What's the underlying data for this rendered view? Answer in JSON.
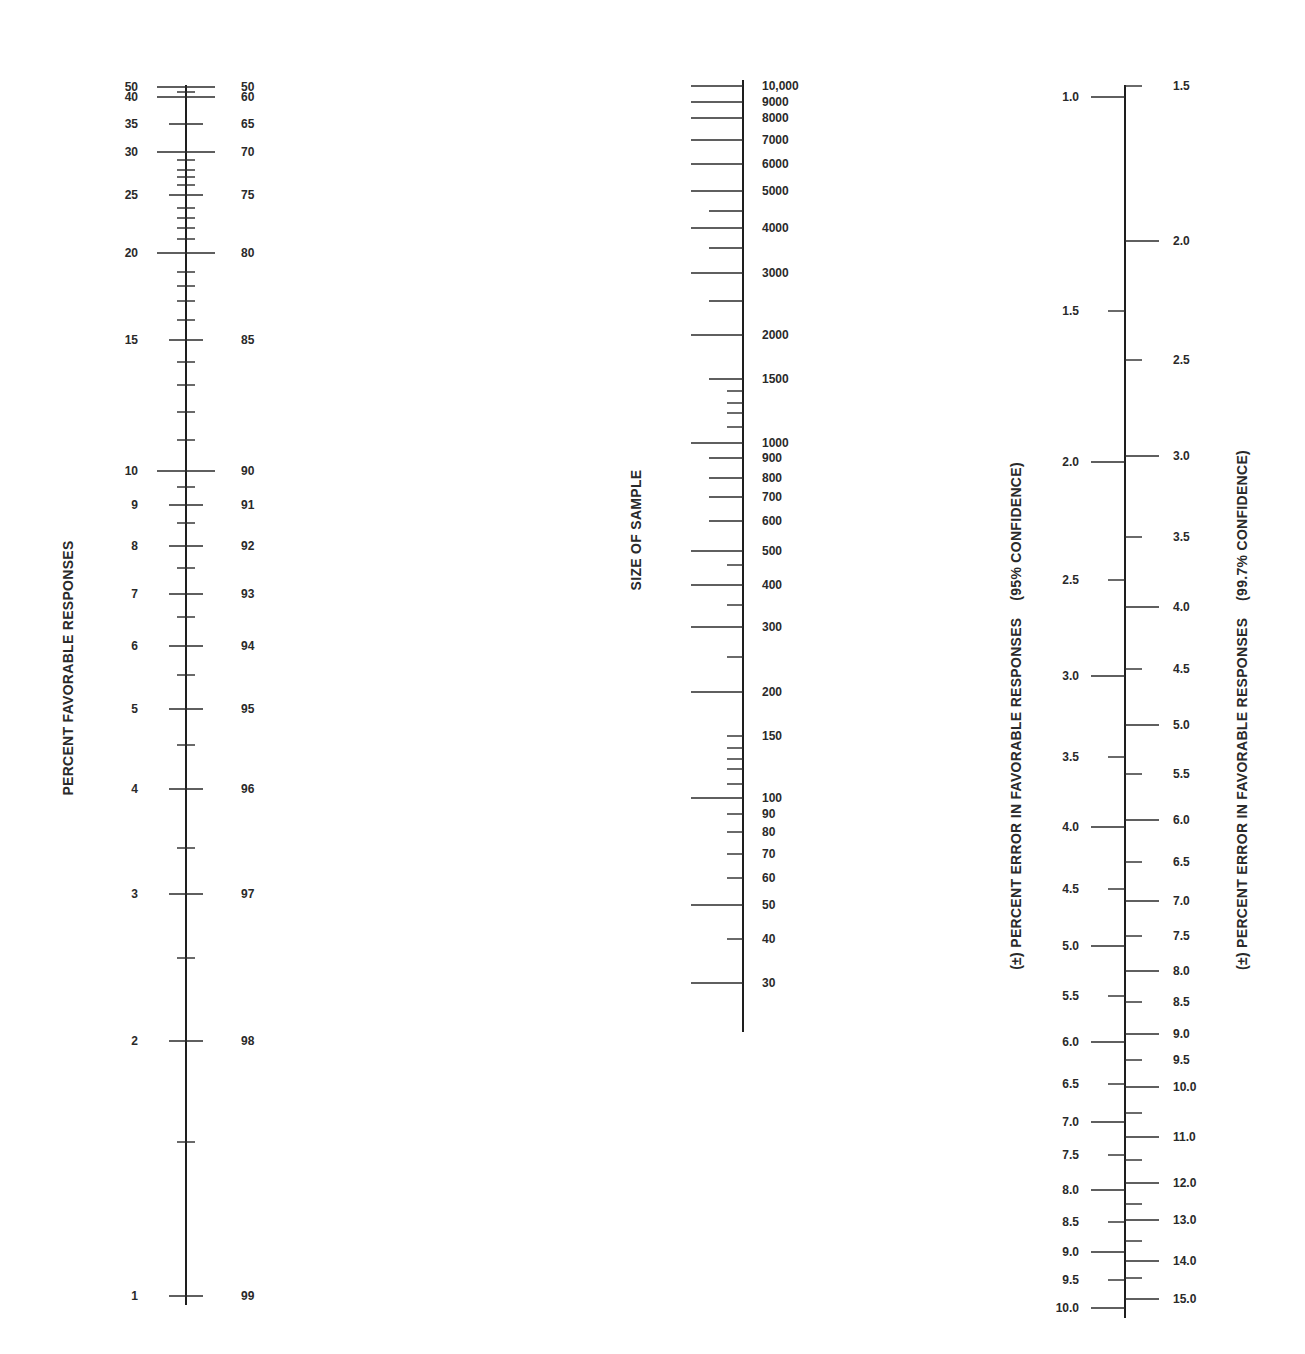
{
  "chart_data": {
    "type": "nomogram",
    "title": "",
    "scales": [
      {
        "id": "percent-favorable",
        "title": "PERCENT FAVORABLE RESPONSES",
        "axis_x": 186,
        "y_range": [
          85,
          1305
        ],
        "labels_left_x": 138,
        "labels_right_x": 241,
        "major_ticks": [
          {
            "left": "50",
            "right": "50",
            "y": 87,
            "len": "long"
          },
          {
            "left": "40",
            "right": "60",
            "y": 97,
            "len": "long"
          },
          {
            "left": "35",
            "right": "65",
            "y": 124,
            "len": "mid"
          },
          {
            "left": "30",
            "right": "70",
            "y": 152,
            "len": "long"
          },
          {
            "left": "25",
            "right": "75",
            "y": 195,
            "len": "mid"
          },
          {
            "left": "20",
            "right": "80",
            "y": 253,
            "len": "long"
          },
          {
            "left": "15",
            "right": "85",
            "y": 340,
            "len": "mid"
          },
          {
            "left": "10",
            "right": "90",
            "y": 471,
            "len": "long"
          },
          {
            "left": "9",
            "right": "91",
            "y": 505,
            "len": "mid"
          },
          {
            "left": "8",
            "right": "92",
            "y": 546,
            "len": "mid"
          },
          {
            "left": "7",
            "right": "93",
            "y": 594,
            "len": "mid"
          },
          {
            "left": "6",
            "right": "94",
            "y": 646,
            "len": "mid"
          },
          {
            "left": "5",
            "right": "95",
            "y": 709,
            "len": "mid"
          },
          {
            "left": "4",
            "right": "96",
            "y": 789,
            "len": "mid"
          },
          {
            "left": "3",
            "right": "97",
            "y": 894,
            "len": "mid"
          },
          {
            "left": "2",
            "right": "98",
            "y": 1041,
            "len": "mid"
          },
          {
            "left": "1",
            "right": "99",
            "y": 1296,
            "len": "mid"
          }
        ],
        "minor_ticks_y": [
          92,
          160,
          170,
          177,
          185,
          208,
          218,
          228,
          239,
          272,
          286,
          301,
          320,
          362,
          385,
          412,
          440,
          487,
          523,
          568,
          617,
          675,
          745,
          848,
          958,
          1142
        ]
      },
      {
        "id": "sample-size",
        "title": "SIZE OF SAMPLE",
        "axis_x": 743,
        "y_range": [
          80,
          1032
        ],
        "labels_x": 762,
        "major_ticks": [
          {
            "label": "10,000",
            "y": 86,
            "len": "long"
          },
          {
            "label": "9000",
            "y": 102,
            "len": "long"
          },
          {
            "label": "8000",
            "y": 118,
            "len": "long"
          },
          {
            "label": "7000",
            "y": 140,
            "len": "long"
          },
          {
            "label": "6000",
            "y": 164,
            "len": "long"
          },
          {
            "label": "5000",
            "y": 191,
            "len": "long"
          },
          {
            "label": "4000",
            "y": 228,
            "len": "long"
          },
          {
            "label": "3000",
            "y": 273,
            "len": "long"
          },
          {
            "label": "2000",
            "y": 335,
            "len": "long"
          },
          {
            "label": "1500",
            "y": 379,
            "len": "mid"
          },
          {
            "label": "1000",
            "y": 443,
            "len": "long"
          },
          {
            "label": "900",
            "y": 458,
            "len": "mid"
          },
          {
            "label": "800",
            "y": 478,
            "len": "mid"
          },
          {
            "label": "700",
            "y": 497,
            "len": "mid"
          },
          {
            "label": "600",
            "y": 521,
            "len": "mid"
          },
          {
            "label": "500",
            "y": 551,
            "len": "long"
          },
          {
            "label": "400",
            "y": 585,
            "len": "long"
          },
          {
            "label": "300",
            "y": 627,
            "len": "long"
          },
          {
            "label": "200",
            "y": 692,
            "len": "long"
          },
          {
            "label": "150",
            "y": 736,
            "len": "short"
          },
          {
            "label": "100",
            "y": 798,
            "len": "long"
          },
          {
            "label": "90",
            "y": 814,
            "len": "short"
          },
          {
            "label": "80",
            "y": 832,
            "len": "short"
          },
          {
            "label": "70",
            "y": 854,
            "len": "short"
          },
          {
            "label": "60",
            "y": 878,
            "len": "short"
          },
          {
            "label": "50",
            "y": 905,
            "len": "long"
          },
          {
            "label": "40",
            "y": 939,
            "len": "short"
          },
          {
            "label": "30",
            "y": 983,
            "len": "long"
          }
        ],
        "minor_ticks": [
          {
            "y": 211,
            "len": "mid"
          },
          {
            "y": 248,
            "len": "mid"
          },
          {
            "y": 301,
            "len": "mid"
          },
          {
            "y": 391,
            "len": "short"
          },
          {
            "y": 403,
            "len": "short"
          },
          {
            "y": 413,
            "len": "short"
          },
          {
            "y": 427,
            "len": "short"
          },
          {
            "y": 565,
            "len": "short"
          },
          {
            "y": 605,
            "len": "short"
          },
          {
            "y": 657,
            "len": "short"
          },
          {
            "y": 748,
            "len": "short"
          },
          {
            "y": 759,
            "len": "short"
          },
          {
            "y": 769,
            "len": "short"
          },
          {
            "y": 784,
            "len": "short"
          }
        ]
      },
      {
        "id": "percent-error",
        "axis_x": 1125,
        "y_range": [
          85,
          1318
        ],
        "left_title": "(±) PERCENT ERROR IN FAVORABLE RESPONSES    (95% CONFIDENCE)",
        "right_title": "(±) PERCENT ERROR IN FAVORABLE RESPONSES    (99.7% CONFIDENCE)",
        "left_labels_x": 1079,
        "left_ticks": [
          {
            "label": "1.0",
            "y": 97,
            "len": "long"
          },
          {
            "label": "1.5",
            "y": 311,
            "len": "short"
          },
          {
            "label": "2.0",
            "y": 462,
            "len": "long"
          },
          {
            "label": "2.5",
            "y": 580,
            "len": "short"
          },
          {
            "label": "3.0",
            "y": 676,
            "len": "long"
          },
          {
            "label": "3.5",
            "y": 757,
            "len": "short"
          },
          {
            "label": "4.0",
            "y": 827,
            "len": "long"
          },
          {
            "label": "4.5",
            "y": 889,
            "len": "short"
          },
          {
            "label": "5.0",
            "y": 946,
            "len": "long"
          },
          {
            "label": "5.5",
            "y": 996,
            "len": "short"
          },
          {
            "label": "6.0",
            "y": 1042,
            "len": "long"
          },
          {
            "label": "6.5",
            "y": 1084,
            "len": "short"
          },
          {
            "label": "7.0",
            "y": 1122,
            "len": "long"
          },
          {
            "label": "7.5",
            "y": 1155,
            "len": "short"
          },
          {
            "label": "8.0",
            "y": 1190,
            "len": "long"
          },
          {
            "label": "8.5",
            "y": 1222,
            "len": "short"
          },
          {
            "label": "9.0",
            "y": 1252,
            "len": "long"
          },
          {
            "label": "9.5",
            "y": 1280,
            "len": "short"
          },
          {
            "label": "10.0",
            "y": 1308,
            "len": "long"
          }
        ],
        "right_labels_x": 1173,
        "right_ticks": [
          {
            "label": "1.5",
            "y": 86,
            "len": "short"
          },
          {
            "label": "2.0",
            "y": 241,
            "len": "long"
          },
          {
            "label": "2.5",
            "y": 360,
            "len": "short"
          },
          {
            "label": "3.0",
            "y": 456,
            "len": "long"
          },
          {
            "label": "3.5",
            "y": 537,
            "len": "short"
          },
          {
            "label": "4.0",
            "y": 607,
            "len": "long"
          },
          {
            "label": "4.5",
            "y": 669,
            "len": "short"
          },
          {
            "label": "5.0",
            "y": 725,
            "len": "long"
          },
          {
            "label": "5.5",
            "y": 774,
            "len": "short"
          },
          {
            "label": "6.0",
            "y": 820,
            "len": "long"
          },
          {
            "label": "6.5",
            "y": 862,
            "len": "short"
          },
          {
            "label": "7.0",
            "y": 901,
            "len": "long"
          },
          {
            "label": "7.5",
            "y": 936,
            "len": "short"
          },
          {
            "label": "8.0",
            "y": 971,
            "len": "long"
          },
          {
            "label": "8.5",
            "y": 1002,
            "len": "short"
          },
          {
            "label": "9.0",
            "y": 1034,
            "len": "long"
          },
          {
            "label": "9.5",
            "y": 1060,
            "len": "short"
          },
          {
            "label": "10.0",
            "y": 1087,
            "len": "long"
          },
          {
            "label": "",
            "y": 1113,
            "len": "short"
          },
          {
            "label": "11.0",
            "y": 1137,
            "len": "long"
          },
          {
            "label": "",
            "y": 1160,
            "len": "short"
          },
          {
            "label": "12.0",
            "y": 1183,
            "len": "long"
          },
          {
            "label": "",
            "y": 1204,
            "len": "short"
          },
          {
            "label": "13.0",
            "y": 1220,
            "len": "long"
          },
          {
            "label": "",
            "y": 1241,
            "len": "short"
          },
          {
            "label": "14.0",
            "y": 1261,
            "len": "long"
          },
          {
            "label": "",
            "y": 1278,
            "len": "short"
          },
          {
            "label": "15.0",
            "y": 1299,
            "len": "long"
          }
        ]
      }
    ]
  },
  "labels": {
    "percent_favorable_title": "PERCENT FAVORABLE RESPONSES",
    "sample_size_title": "SIZE OF SAMPLE",
    "error_95_title": "(±) PERCENT ERROR IN FAVORABLE RESPONSES    (95% CONFIDENCE)",
    "error_997_title": "(±) PERCENT ERROR IN FAVORABLE RESPONSES    (99.7% CONFIDENCE)"
  },
  "colors": {
    "ink": "#1e1e1e",
    "background": "#ffffff"
  }
}
